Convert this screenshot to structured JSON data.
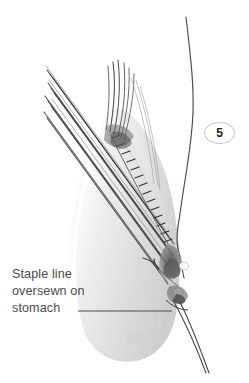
{
  "figure": {
    "title": "Staple line oversewn on stomach",
    "background_color": "#ffffff",
    "width": 249,
    "height": 383,
    "style": "grayscale medical line illustration"
  },
  "badge": {
    "label": "5",
    "shape": "ellipse",
    "border_color": "#c9c9c9",
    "text_color": "#222222"
  },
  "caption": {
    "lines": [
      "Staple line",
      "oversewn on",
      "stomach"
    ],
    "text_color": "#4b4b4b",
    "leader_line": {
      "from_x": 78,
      "to_x": 172,
      "y": 311,
      "color": "#4b4b4b"
    }
  },
  "illustration": {
    "colors": {
      "tissue_fill": "#f2f2f2",
      "tissue_shade": "#dcdcdc",
      "tissue_dark": "#b4b4b4",
      "line_dark": "#3c3c3c",
      "line_mid": "#6e6e6e",
      "suture": "#4a4a4a"
    },
    "parts": [
      {
        "name": "stomach-body",
        "description": "pale translucent stomach remnant silhouette"
      },
      {
        "name": "stapler-lines",
        "description": "bundle of parallel diagonal instrument lines from upper left to lower right",
        "count": 11
      },
      {
        "name": "staple-line-stitches",
        "description": "row of short stitch marks along the oversewn staple line",
        "count": 14
      },
      {
        "name": "suture-thread",
        "description": "long curving suture thread descending from top right into tissue"
      },
      {
        "name": "suture-tails",
        "description": "two suture tails exiting toward lower right"
      },
      {
        "name": "thread-bundle",
        "description": "dark converging thread bundle rising from tissue at upper middle"
      },
      {
        "name": "pointer-hook",
        "description": "small hook-shaped pointer mark near the knot"
      },
      {
        "name": "knot-detail",
        "description": "dark knot and tied suture detail on lower stomach"
      }
    ]
  }
}
